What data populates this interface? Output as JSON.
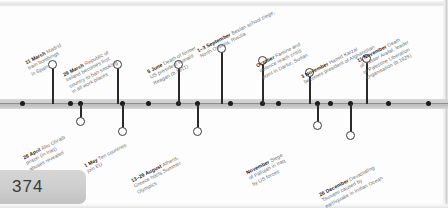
{
  "document": {
    "page_number": "374",
    "timeline_year_context": "2004"
  },
  "colors": {
    "spine": "#cfcfcf",
    "stem": "#2b2b2b",
    "date_text": "#1d1d1d",
    "body_text": "#6f6f6f",
    "page_tab": "#cdcdcd"
  },
  "events_above": [
    {
      "date": "11 March",
      "lines": [
        "Madrid",
        "train bombings",
        "in Spain"
      ],
      "marker": "ring",
      "x": 52,
      "stem_top": 64,
      "stem_height": 40,
      "label_x": 24,
      "label_y": 60
    },
    {
      "date": "29 March",
      "lines": [
        "Republic of",
        "Ireland becomes first",
        "country to ban smoking",
        "in all work places"
      ],
      "marker": "ring",
      "x": 117,
      "stem_top": 64,
      "stem_height": 40,
      "label_x": 62,
      "label_y": 72
    },
    {
      "date": "5 June",
      "lines": [
        "Death of former",
        "US president Ronald",
        "Reagan (b.1911)"
      ],
      "marker": "ring",
      "x": 178,
      "stem_top": 64,
      "stem_height": 40,
      "label_x": 146,
      "label_y": 69
    },
    {
      "date": "1–3 September",
      "lines": [
        "Beslan school siege,",
        "North Ossetia, Russia"
      ],
      "marker": "ring",
      "x": 221,
      "stem_top": 48,
      "stem_height": 56,
      "label_x": 196,
      "label_y": 48
    },
    {
      "date": "October",
      "lines": [
        "Famine and",
        "violence reach crisis",
        "point in Darfur, Sudan"
      ],
      "marker": "ring",
      "x": 262,
      "stem_top": 60,
      "stem_height": 44,
      "label_x": 255,
      "label_y": 63
    },
    {
      "date": "3 November",
      "lines": [
        "Hamid Karzai",
        "becomes president of Afghanistan"
      ],
      "marker": "ring",
      "x": 309,
      "stem_top": 72,
      "stem_height": 32,
      "label_x": 300,
      "label_y": 74
    },
    {
      "date": "11 November",
      "lines": [
        "Death",
        "of Yasser Arafat, leader",
        "of Palestine Liberation",
        "Organisation (b.1929)"
      ],
      "marker": "ring",
      "x": 366,
      "stem_top": 58,
      "stem_height": 46,
      "label_x": 356,
      "label_y": 58
    }
  ],
  "events_below": [
    {
      "date": "28 April",
      "lines": [
        "Abu Ghraib",
        "prison (in Iraq)",
        "abuses revealed"
      ],
      "marker": "ring",
      "x": 80,
      "stem_top": 104,
      "stem_height": 16,
      "label_x": 22,
      "label_y": 155
    },
    {
      "date": "1 May",
      "lines": [
        "Ten countries",
        "join EU"
      ],
      "marker": "ring",
      "x": 122,
      "stem_top": 104,
      "stem_height": 26,
      "label_x": 83,
      "label_y": 163
    },
    {
      "date": "13–29 August",
      "lines": [
        "Athens,",
        "Greece hosts Summer",
        "Olympics"
      ],
      "marker": "ring",
      "x": 197,
      "stem_top": 104,
      "stem_height": 26,
      "label_x": 130,
      "label_y": 178
    },
    {
      "date": "November",
      "lines": [
        "Siege",
        "of Fallujah in Iraq",
        "by US forces"
      ],
      "marker": "ring",
      "x": 317,
      "stem_top": 104,
      "stem_height": 20,
      "label_x": 245,
      "label_y": 170
    },
    {
      "date": "26 December",
      "lines": [
        "Devastating",
        "Tsunami caused by",
        "earthquake in Indian Ocean"
      ],
      "marker": "ring",
      "x": 350,
      "stem_top": 104,
      "stem_height": 30,
      "label_x": 318,
      "label_y": 192
    }
  ],
  "spine_dots": [
    22,
    70,
    80,
    122,
    148,
    178,
    197,
    230,
    262,
    278,
    317,
    330,
    350,
    388,
    428
  ]
}
